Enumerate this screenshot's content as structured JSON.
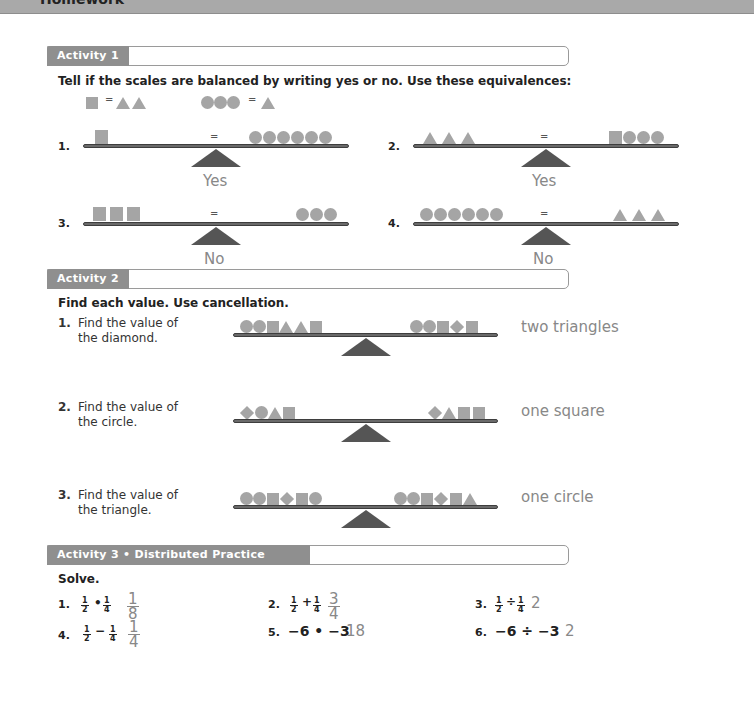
{
  "banner": {
    "title": "Homework"
  },
  "activity1": {
    "tab": "Activity 1",
    "instruction": "Tell if the scales are balanced by writing yes or no. Use these equivalences:",
    "equivalences": [
      {
        "left": [
          "square"
        ],
        "right": [
          "triangle",
          "triangle"
        ]
      },
      {
        "left": [
          "circle",
          "circle",
          "circle"
        ],
        "right": [
          "triangle"
        ]
      }
    ],
    "equals": "=",
    "items": [
      {
        "num": "1.",
        "left": [
          "square"
        ],
        "right": [
          "circle",
          "circle",
          "circle",
          "circle",
          "circle",
          "circle"
        ],
        "answer": "Yes"
      },
      {
        "num": "2.",
        "left": [
          "triangle",
          "triangle",
          "triangle"
        ],
        "right": [
          "square",
          "circle",
          "circle",
          "circle"
        ],
        "answer": "Yes"
      },
      {
        "num": "3.",
        "left": [
          "square",
          "square",
          "square"
        ],
        "right": [
          "circle",
          "circle",
          "circle"
        ],
        "answer": "No"
      },
      {
        "num": "4.",
        "left": [
          "circle",
          "circle",
          "circle",
          "circle",
          "circle",
          "circle"
        ],
        "right": [
          "triangle",
          "triangle",
          "triangle"
        ],
        "answer": "No"
      }
    ]
  },
  "activity2": {
    "tab": "Activity 2",
    "instruction": "Find each value. Use cancellation.",
    "items": [
      {
        "num": "1.",
        "line1": "Find the value of",
        "line2": "the diamond.",
        "left": [
          "circle",
          "circle",
          "square",
          "triangle",
          "triangle",
          "square"
        ],
        "right": [
          "circle",
          "circle",
          "square",
          "diamond",
          "square"
        ],
        "answer": "two triangles"
      },
      {
        "num": "2.",
        "line1": "Find the value of",
        "line2": "the circle.",
        "left": [
          "diamond",
          "circle",
          "triangle",
          "square"
        ],
        "right": [
          "diamond",
          "triangle",
          "square",
          "square"
        ],
        "answer": "one square"
      },
      {
        "num": "3.",
        "line1": "Find the value of",
        "line2": "the triangle.",
        "left": [
          "circle",
          "circle",
          "square",
          "diamond",
          "square",
          "circle"
        ],
        "right": [
          "circle",
          "circle",
          "square",
          "diamond",
          "square",
          "triangle"
        ],
        "answer": "one circle"
      }
    ]
  },
  "activity3": {
    "tab": "Activity 3 • Distributed Practice",
    "instruction": "Solve.",
    "items": [
      {
        "num": "1.",
        "a": {
          "n": "1",
          "d": "2"
        },
        "op": "•",
        "b": {
          "n": "1",
          "d": "4"
        },
        "answer": {
          "n": "1",
          "d": "8"
        }
      },
      {
        "num": "2.",
        "a": {
          "n": "1",
          "d": "2"
        },
        "op": "+",
        "b": {
          "n": "1",
          "d": "4"
        },
        "answer": {
          "n": "3",
          "d": "4"
        }
      },
      {
        "num": "3.",
        "a": {
          "n": "1",
          "d": "2"
        },
        "op": "÷",
        "b": {
          "n": "1",
          "d": "4"
        },
        "answer_plain": "2"
      },
      {
        "num": "4.",
        "a": {
          "n": "1",
          "d": "2"
        },
        "op": "−",
        "b": {
          "n": "1",
          "d": "4"
        },
        "answer": {
          "n": "1",
          "d": "4"
        }
      },
      {
        "num": "5.",
        "expr": "−6 • −3",
        "answer_plain": "18"
      },
      {
        "num": "6.",
        "expr": "−6 ÷ −3",
        "answer_plain": "2"
      }
    ]
  },
  "colors": {
    "shape": "#a5a5a5",
    "tab": "#8f8f8f",
    "answer": "#888888",
    "fulcrum": "#555555"
  }
}
